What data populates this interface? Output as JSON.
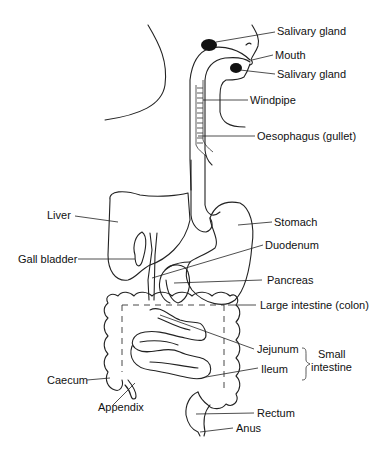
{
  "diagram": {
    "labels": {
      "salivary_gland_upper": "Salivary gland",
      "mouth": "Mouth",
      "salivary_gland_lower": "Salivary gland",
      "windpipe": "Windpipe",
      "oesophagus": "Oesophagus (gullet)",
      "liver": "Liver",
      "stomach": "Stomach",
      "gall_bladder": "Gall bladder",
      "duodenum": "Duodenum",
      "pancreas": "Pancreas",
      "large_intestine": "Large intestine (colon)",
      "jejunum": "Jejunum",
      "small_intestine_line1": "Small",
      "small_intestine_line2": "intestine",
      "ileum": "Ileum",
      "caecum": "Caecum",
      "appendix": "Appendix",
      "rectum": "Rectum",
      "anus": "Anus"
    },
    "colors": {
      "line": "#222222",
      "background": "#ffffff",
      "gland_fill": "#111111"
    }
  }
}
